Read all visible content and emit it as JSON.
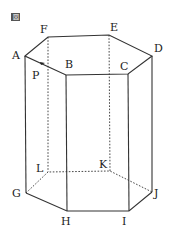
{
  "figure": {
    "badge": "図",
    "labels": {
      "A": "A",
      "B": "B",
      "C": "C",
      "D": "D",
      "E": "E",
      "F": "F",
      "G": "G",
      "H": "H",
      "I": "I",
      "J": "J",
      "K": "K",
      "L": "L",
      "P": "P"
    },
    "colors": {
      "line": "#333333",
      "background": "#ffffff"
    }
  }
}
